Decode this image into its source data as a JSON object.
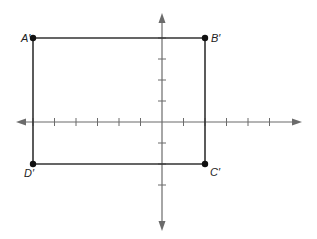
{
  "diagram": {
    "type": "coordinate-plane-rectangle",
    "grid_units": {
      "x_min": -7,
      "x_max": 6,
      "y_min": -5,
      "y_max": 5
    },
    "origin_px": {
      "x": 162,
      "y": 122
    },
    "unit_px": {
      "x": 21.5,
      "y": 21
    },
    "colors": {
      "axis": "#6b6b6b",
      "rectangle": "#333333",
      "vertex": "#111111",
      "label": "#222222",
      "background": "#ffffff"
    },
    "x_ticks": [
      -6,
      -5,
      -4,
      -3,
      -2,
      -1,
      1,
      2,
      3,
      4,
      5
    ],
    "y_ticks": [
      -3,
      -2,
      -1,
      1,
      2,
      3,
      4
    ],
    "vertices": [
      {
        "name": "A′",
        "x": -6,
        "y": 4
      },
      {
        "name": "B′",
        "x": 2,
        "y": 4
      },
      {
        "name": "C′",
        "x": 2,
        "y": -2
      },
      {
        "name": "D′",
        "x": -6,
        "y": -2
      }
    ],
    "labels": {
      "a": "A′",
      "b": "B′",
      "c": "C′",
      "d": "D′"
    }
  }
}
